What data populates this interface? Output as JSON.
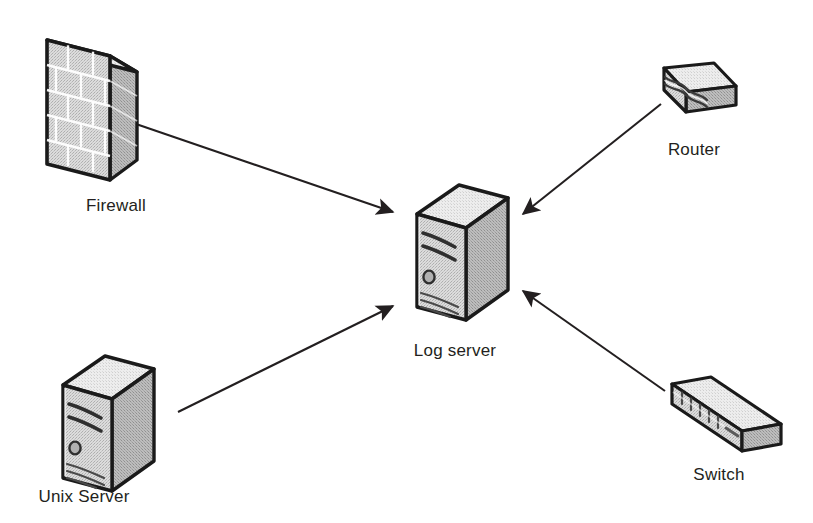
{
  "diagram": {
    "type": "network-topology",
    "background_color": "#ffffff",
    "line_color": "#231f20",
    "label_color": "#231f20",
    "icon_fill_light": "#e8e8e8",
    "icon_fill_mid": "#c9c9c9",
    "icon_fill_dark": "#a8a8a8",
    "icon_outline": "#1a1a1a",
    "nodes": [
      {
        "id": "firewall",
        "label": "Firewall",
        "icon": "firewall-brick-wall-icon",
        "label_x": 116,
        "label_y": 196,
        "role": "source"
      },
      {
        "id": "router",
        "label": "Router",
        "icon": "router-icon",
        "label_x": 694,
        "label_y": 140,
        "role": "source"
      },
      {
        "id": "log-server",
        "label": "Log server",
        "icon": "server-tower-icon",
        "label_x": 455,
        "label_y": 341,
        "role": "destination"
      },
      {
        "id": "unix-server",
        "label": "Unix Server",
        "icon": "server-tower-icon",
        "label_x": 84,
        "label_y": 487,
        "role": "source"
      },
      {
        "id": "switch",
        "label": "Switch",
        "icon": "switch-icon",
        "label_x": 719,
        "label_y": 465,
        "role": "source"
      }
    ],
    "connections": [
      {
        "id": "firewall-to-log-server",
        "from": "firewall",
        "to": "log-server",
        "arrow": "to",
        "x1": 136,
        "y1": 124,
        "x2": 393,
        "y2": 213
      },
      {
        "id": "router-to-log-server",
        "from": "router",
        "to": "log-server",
        "arrow": "to",
        "x1": 661,
        "y1": 104,
        "x2": 521,
        "y2": 215
      },
      {
        "id": "unix-server-to-log-server",
        "from": "unix-server",
        "to": "log-server",
        "arrow": "to",
        "x1": 178,
        "y1": 412,
        "x2": 393,
        "y2": 307
      },
      {
        "id": "switch-to-log-server",
        "from": "switch",
        "to": "log-server",
        "arrow": "to",
        "x1": 665,
        "y1": 391,
        "x2": 521,
        "y2": 292
      }
    ]
  }
}
